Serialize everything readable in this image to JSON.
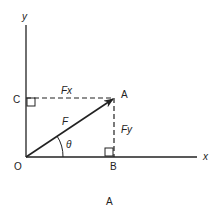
{
  "diagram": {
    "caption": "A",
    "axes": {
      "x_label": "x",
      "y_label": "y"
    },
    "points": {
      "origin": "O",
      "A": "A",
      "B": "B",
      "C": "C"
    },
    "vector_label": "F",
    "components": {
      "horizontal": "Fx",
      "vertical": "Fy"
    },
    "angle_label": "θ",
    "colors": {
      "line": "#222222",
      "background": "#ffffff"
    }
  }
}
